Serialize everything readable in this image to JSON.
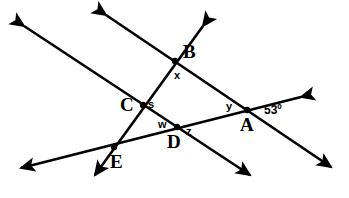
{
  "figure": {
    "kind": "geometry-diagram",
    "width": 349,
    "height": 198,
    "background_color": "#ffffff",
    "stroke_color": "#000000",
    "stroke_width": 2.6
  },
  "points": [
    {
      "id": "A",
      "label": "A",
      "x": 247,
      "y": 110,
      "label_x": 240,
      "label_y": 115
    },
    {
      "id": "B",
      "label": "B",
      "x": 175,
      "y": 61,
      "label_x": 183,
      "label_y": 42
    },
    {
      "id": "C",
      "label": "C",
      "x": 143,
      "y": 105,
      "label_x": 120,
      "label_y": 95
    },
    {
      "id": "D",
      "label": "D",
      "x": 177,
      "y": 127,
      "label_x": 167,
      "label_y": 132
    },
    {
      "id": "E",
      "label": "E",
      "x": 114,
      "y": 147,
      "label_x": 110,
      "label_y": 152
    }
  ],
  "angle_labels": [
    {
      "id": "x",
      "label": "x",
      "x": 174,
      "y": 70
    },
    {
      "id": "s",
      "label": "s",
      "x": 148,
      "y": 99
    },
    {
      "id": "w",
      "label": "w",
      "x": 158,
      "y": 119
    },
    {
      "id": "z",
      "label": "z",
      "x": 186,
      "y": 126
    },
    {
      "id": "y",
      "label": "y",
      "x": 226,
      "y": 101
    },
    {
      "id": "angle53",
      "label": "53º",
      "x": 264,
      "y": 104
    }
  ],
  "lines": [
    {
      "id": "line-BA",
      "name": "line-through-B-and-A",
      "from": {
        "x": 106,
        "y": 15
      },
      "to": {
        "x": 331,
        "y": 167
      },
      "arrow_start": true,
      "arrow_end": true,
      "passes_through": [
        "B",
        "A"
      ]
    },
    {
      "id": "line-CD",
      "name": "line-through-C-and-D",
      "from": {
        "x": 24,
        "y": 26
      },
      "to": {
        "x": 250,
        "y": 175
      },
      "arrow_start": true,
      "arrow_end": true,
      "passes_through": [
        "C",
        "D"
      ]
    },
    {
      "id": "line-BCE",
      "name": "line-through-B-C-and-E",
      "from": {
        "x": 203,
        "y": 26
      },
      "to": {
        "x": 95,
        "y": 175
      },
      "arrow_start": true,
      "arrow_end": true,
      "passes_through": [
        "B",
        "C",
        "E"
      ]
    },
    {
      "id": "line-EDA",
      "name": "line-through-E-D-and-A",
      "from": {
        "x": 301,
        "y": 97
      },
      "to": {
        "x": 21,
        "y": 168
      },
      "arrow_start": true,
      "arrow_end": true,
      "passes_through": [
        "A",
        "D",
        "E"
      ]
    }
  ]
}
